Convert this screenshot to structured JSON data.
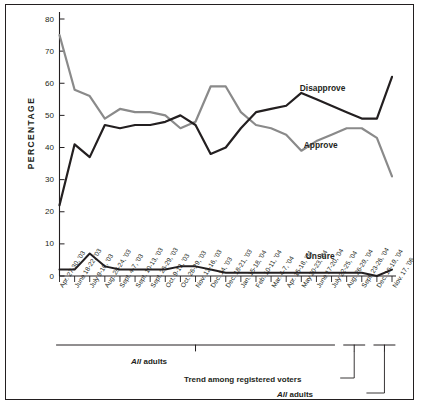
{
  "chart_data": {
    "type": "line",
    "title": "",
    "xlabel": "",
    "ylabel": "PERCENTAGE",
    "ylim": [
      0,
      80
    ],
    "ytick_values": [
      0,
      10,
      20,
      30,
      40,
      50,
      60,
      70,
      80
    ],
    "ytick_labels": [
      "0",
      "10",
      "20",
      "30",
      "40",
      "50",
      "60",
      "70",
      "80"
    ],
    "grid": false,
    "legend_position": "inline-right",
    "categories": [
      "Apr. 27-30, '03",
      "June 18-22, '03",
      "July 9-10, '03",
      "Aug. 20-24, '03",
      "Sept. 4-7, '03",
      "Sept. 10-13, '03",
      "Sept. 26-29, '03",
      "Oct. 9-13, '03",
      "Oct. 26-29, '03",
      "Nov. 12-16, '03",
      "Dec. 14, '03",
      "Dec. 18-21, '03",
      "Jan. 15-18, '04",
      "Feb. 10-11, '04",
      "Mar. 4-7, '04",
      "Apr. 15-18, '04",
      "May 20-23, '04",
      "June 17-20, '04",
      "July 22-25, '04",
      "Aug. 26-29, '04",
      "Sept. 23-26, '04",
      "Dec. 16-19, '04",
      "Nov. 17, '06"
    ],
    "series": [
      {
        "name": "Approve",
        "color": "#8a8a8a",
        "values": [
          75,
          58,
          56,
          49,
          52,
          51,
          51,
          50,
          46,
          48,
          59,
          59,
          51,
          47,
          46,
          44,
          39,
          42,
          44,
          46,
          46,
          43,
          31
        ]
      },
      {
        "name": "Disapprove",
        "color": "#231f20",
        "values": [
          22,
          41,
          37,
          47,
          46,
          47,
          47,
          48,
          50,
          47,
          38,
          40,
          46,
          51,
          52,
          53,
          57,
          55,
          53,
          51,
          49,
          49,
          62
        ]
      },
      {
        "name": "Unsure",
        "color": "#231f20",
        "values": [
          2,
          2,
          7,
          3,
          2,
          2,
          2,
          2,
          3,
          3,
          2,
          1,
          1,
          1,
          1,
          1,
          1,
          1,
          1,
          1,
          1,
          0,
          2
        ]
      }
    ]
  },
  "series_labels": {
    "disapprove": "Disapprove",
    "approve": "Approve",
    "unsure": "Unsure"
  },
  "annotations": {
    "all_adults_left_italic": "All",
    "all_adults_left_rest": " adults",
    "registered_voters": "Trend among registered voters",
    "all_adults_right_italic": "All",
    "all_adults_right_rest": " adults"
  }
}
